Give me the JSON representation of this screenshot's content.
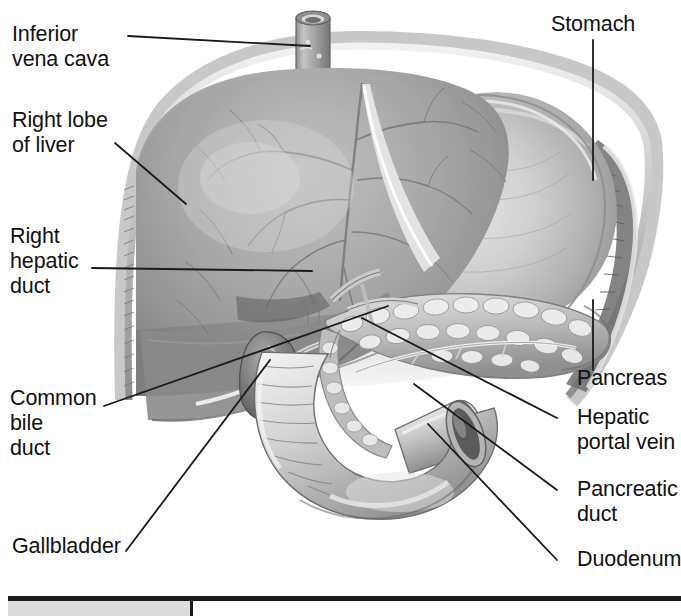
{
  "figure": {
    "style": "grayscale medical illustration",
    "background_color": "#ffffff",
    "text_color": "#111111",
    "leader_color": "#1a1a1a"
  },
  "labels": {
    "inferior_vena_cava": "Inferior\nvena cava",
    "right_lobe_of_liver": "Right lobe\nof liver",
    "right_hepatic_duct": "Right\nhepatic\nduct",
    "common_bile_duct": "Common\nbile\nduct",
    "gallbladder": "Gallbladder",
    "stomach": "Stomach",
    "pancreas": "Pancreas",
    "hepatic_portal_vein": "Hepatic\nportal vein",
    "pancreatic_duct": "Pancreatic\nduct",
    "duodenum": "Duodenum"
  },
  "structures": [
    {
      "name": "inferior vena cava",
      "side": "left"
    },
    {
      "name": "right lobe of liver",
      "side": "left"
    },
    {
      "name": "right hepatic duct",
      "side": "left"
    },
    {
      "name": "common bile duct",
      "side": "left"
    },
    {
      "name": "gallbladder",
      "side": "left"
    },
    {
      "name": "stomach",
      "side": "right"
    },
    {
      "name": "pancreas",
      "side": "right"
    },
    {
      "name": "hepatic portal vein",
      "side": "right"
    },
    {
      "name": "pancreatic duct",
      "side": "right"
    },
    {
      "name": "duodenum",
      "side": "right"
    }
  ],
  "footer": {
    "rule": "table-rule",
    "divider_x": 190
  }
}
